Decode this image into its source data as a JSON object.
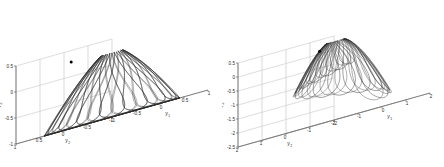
{
  "figure": {
    "background_color": "#ffffff",
    "curve_color": "#2a2a2a",
    "grid_color": "#c8c8c8",
    "axis_color": "#555555",
    "marker_color": "#000000"
  },
  "chart_data": [
    {
      "type": "line",
      "title": "",
      "subtitle": "",
      "panel": "left",
      "projection": "3d",
      "xlabel": "y_1",
      "ylabel": "y_2",
      "zlabel": "y_3",
      "xlabel_display": "y",
      "xlabel_sub": "1",
      "ylabel_display": "y",
      "ylabel_sub": "2",
      "zlabel_display": "y",
      "zlabel_sub": "3",
      "xlim": [
        -1,
        1
      ],
      "ylim": [
        -1,
        1
      ],
      "zlim": [
        -1,
        0.5
      ],
      "xticks": [
        -1,
        -0.5,
        0,
        0.5,
        1
      ],
      "xticklabels": [
        "-1",
        "-0.5",
        "0",
        "0.5",
        "1"
      ],
      "yticks": [
        -1,
        -0.5,
        0,
        0.5,
        1
      ],
      "yticklabels": [
        "-1",
        "-0.5",
        "0",
        "0.5",
        "1"
      ],
      "zticks": [
        -1,
        -0.5,
        0,
        0.5
      ],
      "zticklabels": [
        "-1",
        "-0.5",
        "0",
        "0.5"
      ],
      "grid": true,
      "legend": false,
      "description": "Closed looping trajectory on the surface of a unit hemisphere forming a basket / bowl of petal loops",
      "marker": {
        "label": "start-point",
        "x": -0.55,
        "y": 0.3,
        "z": 0.28
      },
      "series": [
        {
          "name": "trajectory",
          "color": "#2a2a2a",
          "linewidth": 0.5,
          "petals": 16,
          "sphere_radius": 1.0,
          "z_min": -1.0,
          "z_max": 0.35
        }
      ]
    },
    {
      "type": "line",
      "title": "",
      "subtitle": "",
      "panel": "right",
      "projection": "3d",
      "xlabel": "y_1",
      "ylabel": "y_2",
      "zlabel": "y_3",
      "xlabel_display": "y",
      "xlabel_sub": "1",
      "ylabel_display": "y",
      "ylabel_sub": "2",
      "zlabel_display": "y",
      "zlabel_sub": "3",
      "xlim": [
        -2,
        2
      ],
      "ylim": [
        -2,
        2
      ],
      "zlim": [
        -2.5,
        0.5
      ],
      "xticks": [
        -2,
        -1,
        0,
        1,
        2
      ],
      "xticklabels": [
        "-2",
        "-1",
        "0",
        "1",
        "2"
      ],
      "yticks": [
        -2,
        -1,
        0,
        1,
        2
      ],
      "yticklabels": [
        "-2",
        "-1",
        "0",
        "1",
        "2"
      ],
      "zticks": [
        -2.5,
        -2,
        -1.5,
        -1,
        -0.5,
        0,
        0.5
      ],
      "zticklabels": [
        "-2.5",
        "-2",
        "-1.5",
        "-1",
        "-0.5",
        "0",
        "0.5"
      ],
      "grid": true,
      "legend": false,
      "description": "Diverging trajectory spiralling outward and downward forming a lotus / flower of opening arcs",
      "marker": {
        "label": "start-point",
        "x": -0.35,
        "y": 0.25,
        "z": 0.1
      },
      "series": [
        {
          "name": "trajectory",
          "color": "#2a2a2a",
          "linewidth": 0.5,
          "petals": 16,
          "spread_radius": 1.8,
          "z_min": -2.25,
          "z_max": 0.3
        }
      ]
    }
  ]
}
